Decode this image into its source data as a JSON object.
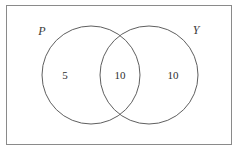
{
  "diagram": {
    "type": "venn-2-set",
    "title": "",
    "universe": {
      "name": "universal-set-rectangle",
      "border_color": "#8a8a8a",
      "fill_color": "#ffffff",
      "x": 6,
      "y": 5,
      "width": 226,
      "height": 140
    },
    "circles": [
      {
        "id": "P",
        "label": "P",
        "name": "circle-p",
        "cx": 91,
        "cy": 75,
        "r": 49,
        "stroke_color": "#5f5f5f",
        "fill_color": "none",
        "label_x": 42,
        "label_y": 35
      },
      {
        "id": "Y",
        "label": "Y",
        "name": "circle-y",
        "cx": 149,
        "cy": 75,
        "r": 49,
        "stroke_color": "#5f5f5f",
        "fill_color": "none",
        "label_x": 196,
        "label_y": 34
      }
    ],
    "regions": [
      {
        "id": "p-only",
        "name": "region-p-only",
        "value": "5",
        "x": 65,
        "y": 79
      },
      {
        "id": "p-and-y",
        "name": "region-intersection",
        "value": "10",
        "x": 120,
        "y": 79
      },
      {
        "id": "y-only",
        "name": "region-y-only",
        "value": "10",
        "x": 173,
        "y": 79
      }
    ]
  }
}
